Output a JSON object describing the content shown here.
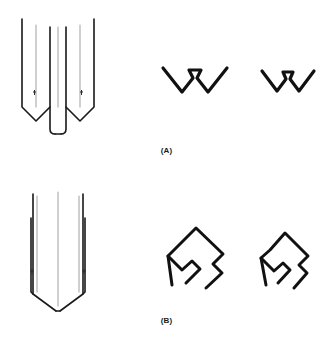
{
  "figure": {
    "background_color": "#ffffff",
    "line_color": "#1a1a1a",
    "light_line_color": "#9a9a9a",
    "width": 333,
    "height": 341
  },
  "panels": [
    {
      "id": "panel-a",
      "label": "(A)",
      "perspective_view": {
        "name": "trocar-point-tube-perspective",
        "description": "Perspective view of a tube with a deep V-notched trocar point and inner cannula"
      },
      "profiles": [
        {
          "name": "profile-wide",
          "description": "Wide V profile with central raised trapezoid tip"
        },
        {
          "name": "profile-narrow",
          "description": "Narrow V profile with central raised trapezoid tip"
        }
      ]
    },
    {
      "id": "panel-b",
      "label": "(B)",
      "perspective_view": {
        "name": "chamfered-point-tube-perspective",
        "description": "Perspective view of a tube with a shallow chamfered conical point"
      },
      "profiles": [
        {
          "name": "profile-wide",
          "description": "Wide chevron profile with notched shoulders"
        },
        {
          "name": "profile-narrow",
          "description": "Narrow chevron profile with notched shoulders"
        }
      ]
    }
  ]
}
